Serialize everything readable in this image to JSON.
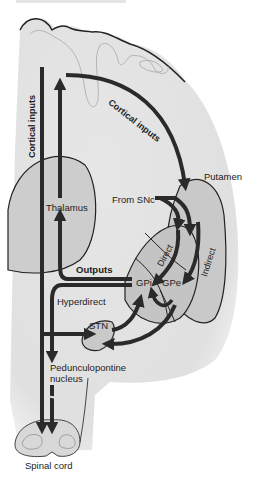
{
  "figure": {
    "type": "basal ganglia circuit diagram",
    "title_cropped": true
  },
  "labels": {
    "cortical_inputs_vertical": "Cortical inputs",
    "cortical_inputs_curved": "Cortical inputs",
    "putamen": "Putamen",
    "from_snc": "From SNc",
    "thalamus": "Thalamus",
    "direct": "Direct",
    "indirect": "Indirect",
    "outputs": "Outputs",
    "gpi": "GPi",
    "gpe": "GPe",
    "hyperdirect": "Hyperdirect",
    "stn": "STN",
    "pedunculopontine_line1": "Pedunculopontine",
    "pedunculopontine_line2": "nucleus",
    "spinal_cord": "Spinal cord"
  },
  "colors": {
    "brain_fill": "#e3e3e3",
    "structure_fill": "#c9c9c9",
    "pathway": "#2a2a2a",
    "outline": "#333333",
    "gyri_lines": "#a8a8a8"
  }
}
